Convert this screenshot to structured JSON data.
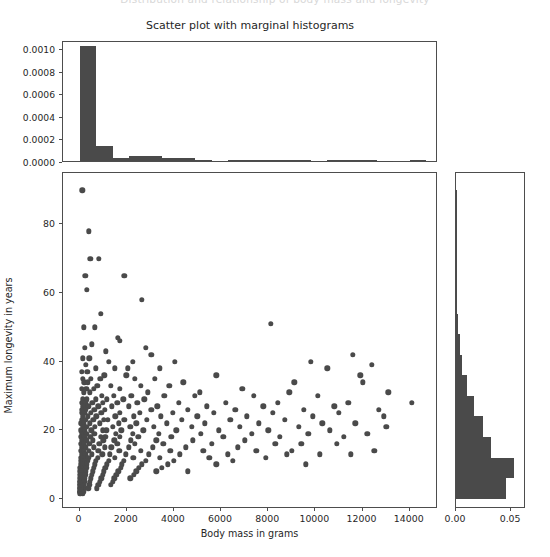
{
  "figure": {
    "clipped_supertitle": "Distribution and relationship of body mass and longevity",
    "title": "Scatter plot with marginal histograms",
    "marker_color": "#4a4a4a",
    "axes_color": "#4d4d4d",
    "background": "#ffffff"
  },
  "chart_data": {
    "type": "scatter",
    "title": "Scatter plot with marginal histograms",
    "xlabel": "Body mass in grams",
    "ylabel": "Maximum longevity in years",
    "xlim": [
      -700,
      15200
    ],
    "ylim": [
      -3,
      95
    ],
    "grid": false,
    "legend": null,
    "xticks": [
      0,
      2000,
      4000,
      6000,
      8000,
      10000,
      12000,
      14000
    ],
    "xticklabels": [
      "0",
      "2000",
      "4000",
      "6000",
      "8000",
      "10000",
      "12000",
      "14000"
    ],
    "yticks": [
      0,
      20,
      40,
      60,
      80
    ],
    "yticklabels": [
      "0",
      "20",
      "40",
      "60",
      "80"
    ],
    "points": [
      [
        120,
        90
      ],
      [
        390,
        78
      ],
      [
        460,
        70
      ],
      [
        820,
        70
      ],
      [
        250,
        65
      ],
      [
        1900,
        65
      ],
      [
        300,
        61
      ],
      [
        2650,
        58
      ],
      [
        900,
        54
      ],
      [
        8100,
        51
      ],
      [
        180,
        50
      ],
      [
        640,
        50
      ],
      [
        1620,
        47
      ],
      [
        1700,
        46
      ],
      [
        520,
        45
      ],
      [
        230,
        44
      ],
      [
        2800,
        44
      ],
      [
        1120,
        43
      ],
      [
        3050,
        42
      ],
      [
        11600,
        42
      ],
      [
        140,
        41
      ],
      [
        410,
        41
      ],
      [
        1250,
        40
      ],
      [
        2250,
        40
      ],
      [
        4050,
        40
      ],
      [
        9800,
        40
      ],
      [
        12400,
        39
      ],
      [
        260,
        39
      ],
      [
        700,
        38
      ],
      [
        1500,
        38
      ],
      [
        2050,
        38
      ],
      [
        3400,
        38
      ],
      [
        10500,
        38
      ],
      [
        95,
        37
      ],
      [
        330,
        37
      ],
      [
        1050,
        36
      ],
      [
        1980,
        36
      ],
      [
        5800,
        36
      ],
      [
        11900,
        36
      ],
      [
        150,
        35
      ],
      [
        480,
        35
      ],
      [
        880,
        35
      ],
      [
        2350,
        35
      ],
      [
        3200,
        35
      ],
      [
        4400,
        34
      ],
      [
        9100,
        34
      ],
      [
        12000,
        34
      ],
      [
        200,
        34
      ],
      [
        360,
        34
      ],
      [
        760,
        33
      ],
      [
        1320,
        33
      ],
      [
        2600,
        33
      ],
      [
        3800,
        33
      ],
      [
        6900,
        32
      ],
      [
        105,
        32
      ],
      [
        290,
        32
      ],
      [
        600,
        32
      ],
      [
        1700,
        32
      ],
      [
        2900,
        31
      ],
      [
        5100,
        31
      ],
      [
        8900,
        31
      ],
      [
        13100,
        31
      ],
      [
        170,
        31
      ],
      [
        430,
        31
      ],
      [
        950,
        30
      ],
      [
        1450,
        30
      ],
      [
        2200,
        30
      ],
      [
        3600,
        30
      ],
      [
        4900,
        30
      ],
      [
        7400,
        30
      ],
      [
        10100,
        30
      ],
      [
        14100,
        28
      ],
      [
        130,
        29
      ],
      [
        310,
        29
      ],
      [
        680,
        29
      ],
      [
        1150,
        29
      ],
      [
        1850,
        29
      ],
      [
        2750,
        29
      ],
      [
        4200,
        28
      ],
      [
        6200,
        28
      ],
      [
        8400,
        28
      ],
      [
        11400,
        28
      ],
      [
        90,
        28
      ],
      [
        240,
        28
      ],
      [
        540,
        28
      ],
      [
        1000,
        28
      ],
      [
        1600,
        28
      ],
      [
        2450,
        28
      ],
      [
        3300,
        27
      ],
      [
        5400,
        27
      ],
      [
        7800,
        27
      ],
      [
        10800,
        27
      ],
      [
        155,
        27
      ],
      [
        380,
        27
      ],
      [
        790,
        27
      ],
      [
        1380,
        27
      ],
      [
        2100,
        27
      ],
      [
        3050,
        26
      ],
      [
        4600,
        26
      ],
      [
        6600,
        26
      ],
      [
        9500,
        26
      ],
      [
        12700,
        26
      ],
      [
        110,
        26
      ],
      [
        275,
        26
      ],
      [
        620,
        26
      ],
      [
        1080,
        26
      ],
      [
        1720,
        25
      ],
      [
        2550,
        25
      ],
      [
        3950,
        25
      ],
      [
        5700,
        25
      ],
      [
        8200,
        25
      ],
      [
        11000,
        25
      ],
      [
        85,
        25
      ],
      [
        205,
        25
      ],
      [
        470,
        25
      ],
      [
        930,
        25
      ],
      [
        1520,
        24
      ],
      [
        2300,
        24
      ],
      [
        3450,
        24
      ],
      [
        5000,
        24
      ],
      [
        7100,
        24
      ],
      [
        9900,
        24
      ],
      [
        12900,
        24
      ],
      [
        145,
        24
      ],
      [
        345,
        24
      ],
      [
        720,
        24
      ],
      [
        1200,
        23
      ],
      [
        1900,
        23
      ],
      [
        2850,
        23
      ],
      [
        4350,
        23
      ],
      [
        6400,
        23
      ],
      [
        8700,
        23
      ],
      [
        11700,
        22
      ],
      [
        100,
        23
      ],
      [
        255,
        23
      ],
      [
        580,
        23
      ],
      [
        1030,
        23
      ],
      [
        1660,
        22
      ],
      [
        2400,
        22
      ],
      [
        3700,
        22
      ],
      [
        5300,
        22
      ],
      [
        7600,
        22
      ],
      [
        10300,
        22
      ],
      [
        75,
        22
      ],
      [
        190,
        22
      ],
      [
        440,
        22
      ],
      [
        870,
        22
      ],
      [
        1420,
        21
      ],
      [
        2150,
        21
      ],
      [
        3150,
        21
      ],
      [
        4750,
        21
      ],
      [
        6800,
        21
      ],
      [
        9300,
        21
      ],
      [
        13000,
        21
      ],
      [
        135,
        21
      ],
      [
        320,
        21
      ],
      [
        660,
        21
      ],
      [
        1130,
        20
      ],
      [
        1780,
        20
      ],
      [
        2700,
        20
      ],
      [
        4100,
        20
      ],
      [
        5900,
        20
      ],
      [
        8000,
        20
      ],
      [
        10600,
        20
      ],
      [
        65,
        20
      ],
      [
        225,
        20
      ],
      [
        500,
        20
      ],
      [
        980,
        20
      ],
      [
        1550,
        19
      ],
      [
        2250,
        19
      ],
      [
        3350,
        19
      ],
      [
        5150,
        19
      ],
      [
        7300,
        19
      ],
      [
        9700,
        19
      ],
      [
        12200,
        19
      ],
      [
        125,
        19
      ],
      [
        295,
        19
      ],
      [
        630,
        19
      ],
      [
        1090,
        18
      ],
      [
        1700,
        18
      ],
      [
        2500,
        18
      ],
      [
        3900,
        18
      ],
      [
        6100,
        18
      ],
      [
        8500,
        18
      ],
      [
        11200,
        18
      ],
      [
        80,
        18
      ],
      [
        210,
        18
      ],
      [
        460,
        18
      ],
      [
        900,
        18
      ],
      [
        1470,
        17
      ],
      [
        2180,
        17
      ],
      [
        3250,
        17
      ],
      [
        4800,
        17
      ],
      [
        7000,
        17
      ],
      [
        9400,
        16
      ],
      [
        115,
        17
      ],
      [
        280,
        17
      ],
      [
        560,
        17
      ],
      [
        1010,
        17
      ],
      [
        1610,
        16
      ],
      [
        2350,
        16
      ],
      [
        3550,
        16
      ],
      [
        5600,
        16
      ],
      [
        8300,
        16
      ],
      [
        10900,
        16
      ],
      [
        70,
        16
      ],
      [
        185,
        16
      ],
      [
        420,
        16
      ],
      [
        840,
        16
      ],
      [
        1340,
        15
      ],
      [
        2080,
        15
      ],
      [
        3100,
        15
      ],
      [
        4500,
        15
      ],
      [
        6700,
        15
      ],
      [
        9000,
        14
      ],
      [
        12500,
        14
      ],
      [
        105,
        15
      ],
      [
        265,
        15
      ],
      [
        600,
        15
      ],
      [
        1060,
        15
      ],
      [
        1690,
        14
      ],
      [
        2600,
        14
      ],
      [
        3850,
        14
      ],
      [
        5250,
        14
      ],
      [
        7500,
        14
      ],
      [
        10200,
        13
      ],
      [
        60,
        14
      ],
      [
        175,
        14
      ],
      [
        400,
        14
      ],
      [
        800,
        14
      ],
      [
        1280,
        13
      ],
      [
        1950,
        13
      ],
      [
        2950,
        13
      ],
      [
        4250,
        13
      ],
      [
        6300,
        13
      ],
      [
        8800,
        13
      ],
      [
        11500,
        13
      ],
      [
        95,
        13
      ],
      [
        245,
        13
      ],
      [
        530,
        13
      ],
      [
        960,
        13
      ],
      [
        1500,
        12
      ],
      [
        2280,
        12
      ],
      [
        3400,
        12
      ],
      [
        5500,
        12
      ],
      [
        7900,
        12
      ],
      [
        9600,
        10
      ],
      [
        55,
        12
      ],
      [
        165,
        12
      ],
      [
        370,
        12
      ],
      [
        770,
        12
      ],
      [
        1230,
        11
      ],
      [
        1880,
        11
      ],
      [
        2800,
        11
      ],
      [
        4000,
        11
      ],
      [
        6500,
        11
      ],
      [
        50,
        11
      ],
      [
        155,
        11
      ],
      [
        340,
        11
      ],
      [
        700,
        11
      ],
      [
        1170,
        10
      ],
      [
        1800,
        10
      ],
      [
        2650,
        10
      ],
      [
        3750,
        10
      ],
      [
        5800,
        10
      ],
      [
        45,
        10
      ],
      [
        140,
        10
      ],
      [
        310,
        10
      ],
      [
        660,
        10
      ],
      [
        1100,
        9
      ],
      [
        1740,
        9
      ],
      [
        2520,
        9
      ],
      [
        3500,
        9
      ],
      [
        40,
        9
      ],
      [
        130,
        9
      ],
      [
        290,
        9
      ],
      [
        610,
        9
      ],
      [
        1040,
        8
      ],
      [
        1640,
        8
      ],
      [
        2400,
        8
      ],
      [
        3250,
        8
      ],
      [
        4600,
        8
      ],
      [
        35,
        8
      ],
      [
        120,
        8
      ],
      [
        270,
        8
      ],
      [
        570,
        8
      ],
      [
        980,
        7
      ],
      [
        1560,
        7
      ],
      [
        2300,
        7
      ],
      [
        30,
        7
      ],
      [
        110,
        7
      ],
      [
        250,
        7
      ],
      [
        520,
        7
      ],
      [
        920,
        6
      ],
      [
        1480,
        6
      ],
      [
        2150,
        6
      ],
      [
        25,
        6
      ],
      [
        100,
        6
      ],
      [
        230,
        6
      ],
      [
        480,
        6
      ],
      [
        860,
        5
      ],
      [
        1400,
        5
      ],
      [
        20,
        5
      ],
      [
        90,
        5
      ],
      [
        210,
        5
      ],
      [
        440,
        5
      ],
      [
        800,
        4
      ],
      [
        1320,
        4
      ],
      [
        18,
        4
      ],
      [
        80,
        4
      ],
      [
        195,
        4
      ],
      [
        410,
        4
      ],
      [
        740,
        3
      ],
      [
        15,
        3
      ],
      [
        70,
        3
      ],
      [
        180,
        3
      ],
      [
        380,
        3
      ],
      [
        12,
        2
      ],
      [
        60,
        2
      ],
      [
        165,
        2
      ],
      [
        10,
        2
      ],
      [
        55,
        2
      ],
      [
        150,
        1.5
      ],
      [
        8,
        1.5
      ],
      [
        48,
        1.5
      ],
      [
        6,
        2
      ],
      [
        42,
        2.5
      ],
      [
        35,
        3
      ],
      [
        28,
        4
      ],
      [
        22,
        5
      ]
    ]
  },
  "top_histogram": {
    "type": "bar",
    "orientation": "vertical",
    "ylabel": "",
    "yticks": [
      0.0,
      0.0002,
      0.0004,
      0.0006,
      0.0008,
      0.001
    ],
    "yticklabels": [
      "0.0000",
      "0.0002",
      "0.0004",
      "0.0006",
      "0.0008",
      "0.0010"
    ],
    "ylim": [
      0,
      0.00107
    ],
    "xlim": [
      -700,
      15200
    ],
    "bin_edges": [
      0,
      700,
      1400,
      2100,
      2800,
      3500,
      4200,
      4900,
      5600,
      6300,
      7000,
      7700,
      8400,
      9100,
      9800,
      10500,
      11200,
      11900,
      12600,
      13300,
      14000,
      14700
    ],
    "densities": [
      0.001015,
      0.000134,
      3.1e-05,
      4.6e-05,
      4.4e-05,
      2.8e-05,
      2.7e-05,
      1.1e-05,
      0.0,
      6e-06,
      7e-06,
      5e-06,
      1e-05,
      9e-06,
      4e-06,
      8e-06,
      9e-06,
      7e-06,
      3e-06,
      0.0,
      6e-06
    ]
  },
  "right_histogram": {
    "type": "bar",
    "orientation": "horizontal",
    "xticks": [
      0.0,
      0.05
    ],
    "xticklabels": [
      "0.00",
      "0.05"
    ],
    "xlim": [
      0,
      0.0635
    ],
    "ylim": [
      -3,
      95
    ],
    "bin_edges": [
      0,
      6,
      12,
      18,
      24,
      30,
      36,
      42,
      48,
      54,
      60,
      66,
      72,
      78,
      84,
      90
    ],
    "densities": [
      0.0452,
      0.0525,
      0.0322,
      0.0245,
      0.0163,
      0.0098,
      0.0055,
      0.0036,
      0.0018,
      0.0011,
      0.0009,
      0.0005,
      0.0004,
      0.0003,
      0.0002
    ]
  }
}
